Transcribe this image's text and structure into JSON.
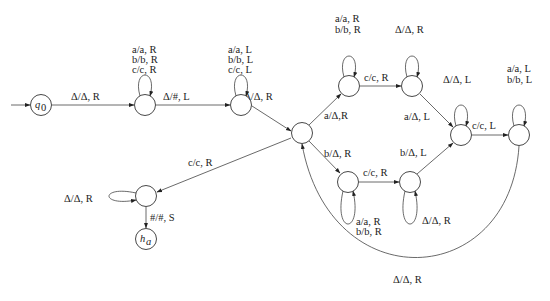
{
  "diagram": {
    "states": [
      {
        "id": "q0",
        "label": "q0",
        "display_main": "q",
        "display_sub": "0",
        "x": 41,
        "y": 105,
        "start": true
      },
      {
        "id": "s1",
        "label": "",
        "x": 145,
        "y": 105
      },
      {
        "id": "s2",
        "label": "",
        "x": 241,
        "y": 105
      },
      {
        "id": "s3",
        "label": "",
        "x": 302,
        "y": 133
      },
      {
        "id": "s4",
        "label": "",
        "x": 349,
        "y": 86
      },
      {
        "id": "s5",
        "label": "",
        "x": 412,
        "y": 86
      },
      {
        "id": "s6",
        "label": "",
        "x": 461,
        "y": 135
      },
      {
        "id": "s7",
        "label": "",
        "x": 519,
        "y": 135
      },
      {
        "id": "s8",
        "label": "",
        "x": 348,
        "y": 182
      },
      {
        "id": "s9",
        "label": "",
        "x": 410,
        "y": 182
      },
      {
        "id": "s10",
        "label": "",
        "x": 146,
        "y": 196
      },
      {
        "id": "ha",
        "label": "ha",
        "display_main": "h",
        "display_sub": "a",
        "x": 146,
        "y": 239,
        "halt": true
      }
    ],
    "labels": {
      "q0_s1": "Δ/Δ, R",
      "s1_loop": [
        "a/a, R",
        "b/b, R",
        "c/c, R"
      ],
      "s1_s2": "Δ/#, L",
      "s2_loop": [
        "a/a, L",
        "b/b, L",
        "c/c, L"
      ],
      "s2_s3": "Δ/Δ, R",
      "s3_s4": "a/Δ,R",
      "s4_loop": [
        "a/a, R",
        "b/b, R"
      ],
      "s4_s5": "c/c, R",
      "s5_loop": [
        "Δ/Δ, R"
      ],
      "s5_s6": "a/Δ, L",
      "s6_loop": [
        "Δ/Δ, L"
      ],
      "s6_s7": "c/c, L",
      "s7_loop": [
        "a/a, L",
        "b/b, L"
      ],
      "s3_s8": "b/Δ, R",
      "s8_loop": [
        "a/a, R",
        "b/b, R"
      ],
      "s8_s9": "c/c, R",
      "s9_loop": [
        "Δ/Δ, R"
      ],
      "s9_s6": "b/Δ, L",
      "s7_s3": "Δ/Δ, R",
      "s3_s10": "c/c, R",
      "s10_loop": [
        "Δ/Δ, R"
      ],
      "s10_ha": "#/#, S"
    }
  }
}
